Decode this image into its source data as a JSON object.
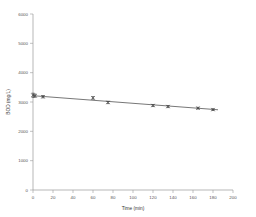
{
  "chart_data": {
    "type": "scatter",
    "title": "",
    "xlabel": "Time (min)",
    "ylabel": "BOD (mg/L)",
    "xlim": [
      0,
      200
    ],
    "ylim": [
      0,
      6000
    ],
    "grid": false,
    "legend": null,
    "x_ticks": [
      0,
      20,
      40,
      60,
      80,
      100,
      120,
      140,
      160,
      180,
      200
    ],
    "y_ticks": [
      0,
      1000,
      2000,
      3000,
      4000,
      5000,
      6000
    ],
    "x_tick_labels": [
      "0",
      "20",
      "40",
      "60",
      "80",
      "100",
      "120",
      "140",
      "160",
      "180",
      "200"
    ],
    "y_tick_labels": [
      "0",
      "1000",
      "2000",
      "3000",
      "4000",
      "5000",
      "6000"
    ],
    "marker_style": "cross-with-error-bar",
    "series": [
      {
        "name": "BOD measurement",
        "x": [
          0,
          2,
          10,
          60,
          75,
          120,
          135,
          165,
          180
        ],
        "y": [
          3230,
          3215,
          3180,
          3140,
          2985,
          2880,
          2845,
          2790,
          2740
        ],
        "y_err": [
          70,
          55,
          40,
          45,
          40,
          35,
          35,
          30,
          30
        ]
      },
      {
        "name": "linear fit",
        "type": "line",
        "x": [
          0,
          185
        ],
        "y": [
          3215,
          2735
        ]
      }
    ]
  },
  "axes": {
    "x_axis_name": "Time (min)",
    "y_axis_name": "BOD (mg/L)"
  }
}
